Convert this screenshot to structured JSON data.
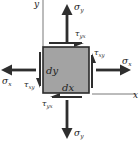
{
  "diagram": {
    "type": "stress-element",
    "axes": {
      "x_label": "x",
      "y_label": "y"
    },
    "element": {
      "width_label": "dx",
      "height_label": "dy",
      "fill": "#a3a3a3",
      "border": "#2a2a2a"
    },
    "normal_stresses": {
      "top": {
        "symbol": "σ",
        "sub": "y"
      },
      "bottom": {
        "symbol": "σ",
        "sub": "y"
      },
      "left": {
        "symbol": "σ",
        "sub": "x"
      },
      "right": {
        "symbol": "σ",
        "sub": "x"
      }
    },
    "shear_stresses": {
      "top": {
        "symbol": "τ",
        "sub": "yx"
      },
      "bottom": {
        "symbol": "τ",
        "sub": "yx"
      },
      "left": {
        "symbol": "τ",
        "sub": "xy"
      },
      "right": {
        "symbol": "τ",
        "sub": "xy"
      }
    },
    "arrow_color": "#2e2e2e",
    "axis_color": "#555555"
  }
}
